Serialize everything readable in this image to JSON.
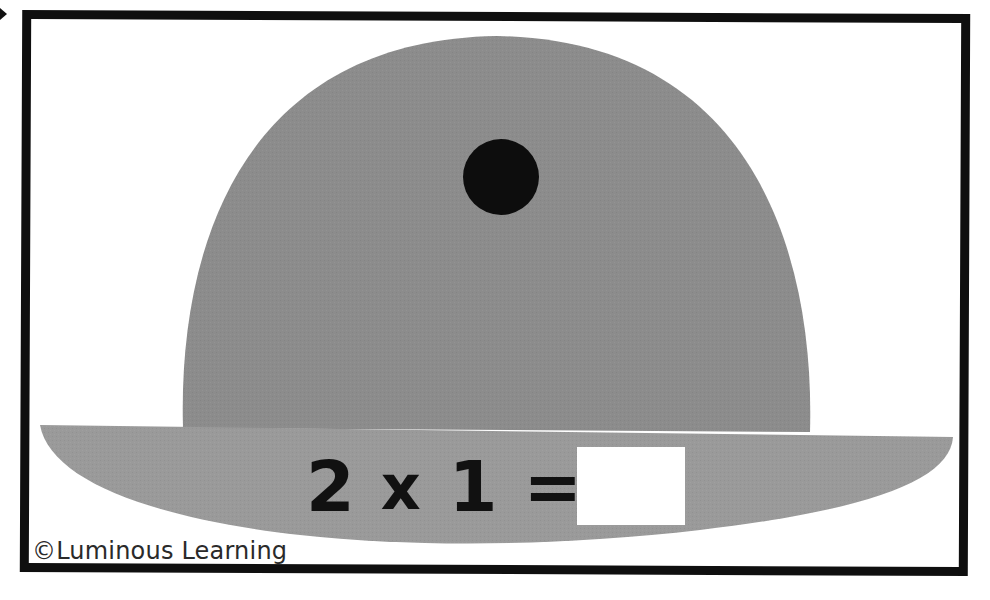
{
  "card": {
    "title": "Multiplication flash card",
    "equation": {
      "operand_a": "2",
      "operator": "x",
      "operand_b": "1",
      "equals": "=",
      "answer_value": ""
    },
    "copyright": "©Luminous Learning"
  },
  "illustration": {
    "subject": "bowler-hat",
    "dot_count": 1,
    "colors": {
      "crown": "#8c8c8c",
      "brim": "#9a9a9a",
      "dot": "#0d0d0d",
      "frame": "#0f0f0f",
      "background": "#ffffff"
    }
  }
}
